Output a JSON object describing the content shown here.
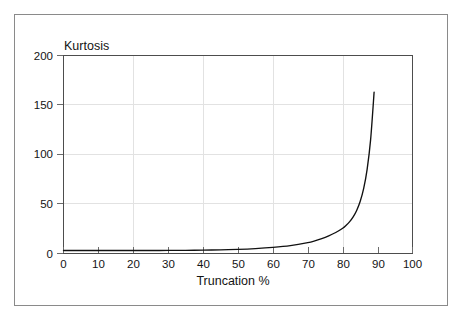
{
  "figure": {
    "background_color": "#ffffff",
    "frame_color": "#8a8a8a",
    "axis_color": "#4d4d4d",
    "grid_color": "#e2e2e2",
    "curve_color": "#111111"
  },
  "chart_data": {
    "type": "line",
    "title": "",
    "subtitle": "",
    "xlabel": "Truncation %",
    "ylabel": "Kurtosis",
    "xlim": [
      0,
      100
    ],
    "ylim": [
      0,
      200
    ],
    "grid": true,
    "legend": false,
    "legend_position": "none",
    "x_ticks": [
      0,
      10,
      20,
      30,
      40,
      50,
      60,
      70,
      80,
      90,
      100
    ],
    "x_tick_labels": [
      "0",
      "10",
      "20",
      "30",
      "40",
      "50",
      "60",
      "70",
      "80",
      "90",
      "100"
    ],
    "y_ticks": [
      0,
      50,
      100,
      150,
      200
    ],
    "y_tick_labels": [
      "0",
      "50",
      "100",
      "150",
      "200"
    ],
    "x_gridlines": [
      20,
      40,
      60,
      80
    ],
    "y_gridlines": [
      50,
      100,
      150
    ],
    "series": [
      {
        "name": "Kurtosis vs Truncation",
        "x": [
          0,
          5,
          10,
          15,
          20,
          25,
          30,
          35,
          40,
          45,
          50,
          55,
          60,
          65,
          70,
          72,
          74,
          76,
          78,
          80,
          81,
          82,
          83,
          84,
          85,
          86,
          87,
          88,
          89
        ],
        "values": [
          3.0,
          3.0,
          3.0,
          3.0,
          3.0,
          3.0,
          3.1,
          3.2,
          3.4,
          3.7,
          4.2,
          5.0,
          6.2,
          8.0,
          11.0,
          12.8,
          15.0,
          17.8,
          21.2,
          25.5,
          28.5,
          32.2,
          37.0,
          43.5,
          52.5,
          65.5,
          85.0,
          115.0,
          163.0
        ]
      }
    ],
    "annotations": []
  },
  "labels": {
    "y_axis_title": "Kurtosis",
    "x_axis_title": "Truncation %"
  }
}
